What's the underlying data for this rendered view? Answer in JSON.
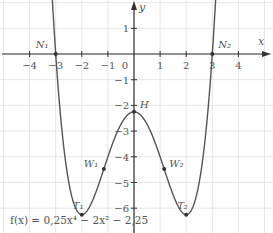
{
  "chart_data": {
    "type": "line",
    "title": "",
    "function_label": "f(x) = 0,25x⁴ − 2x² − 2,25",
    "xlabel": "x",
    "ylabel": "y",
    "xlim": [
      -5,
      5.2
    ],
    "ylim": [
      -6.8,
      2.1
    ],
    "grid": true,
    "x_ticks": [
      -4,
      -3,
      -2,
      -1,
      0,
      1,
      2,
      3,
      4
    ],
    "y_ticks": [
      1,
      -1,
      -2,
      -3,
      -4,
      -5,
      -6
    ],
    "x_tick_labels": [
      "−4",
      "−3",
      "−2",
      "−1",
      "0",
      "1",
      "2",
      "3",
      "4"
    ],
    "y_tick_labels": [
      "1",
      "−1",
      "−2",
      "−3",
      "−4",
      "−5",
      "−6"
    ],
    "series": [
      {
        "name": "f(x) = 0,25x⁴ − 2x² − 2,25",
        "coefficients": {
          "a4": 0.25,
          "a2": -2,
          "a0": -2.25
        }
      }
    ],
    "points": [
      {
        "label": "N₁",
        "x": -3,
        "y": 0
      },
      {
        "label": "N₂",
        "x": 3,
        "y": 0
      },
      {
        "label": "H",
        "x": 0,
        "y": -2.25
      },
      {
        "label": "T₁",
        "x": -2,
        "y": -6.25
      },
      {
        "label": "T₂",
        "x": 2,
        "y": -6.25
      },
      {
        "label": "W₁",
        "x": -1.1547,
        "y": -4.4722
      },
      {
        "label": "W₂",
        "x": 1.1547,
        "y": -4.4722
      }
    ],
    "colors": {
      "curve": "#555555",
      "axis": "#333333",
      "grid": "#e6e6e6",
      "text": "#555555"
    }
  }
}
